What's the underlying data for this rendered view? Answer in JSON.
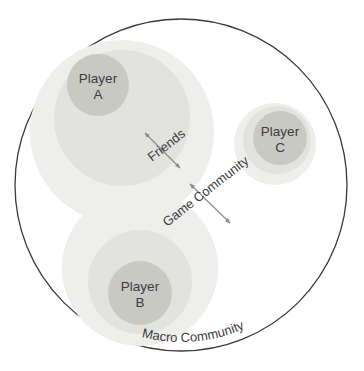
{
  "diagram": {
    "type": "nested-circle-venn",
    "background_color": "#ffffff",
    "outer": {
      "name": "Macro Community",
      "label": "Macro Community",
      "stroke_color": "#3a3a3a",
      "fill_color": "#ffffff",
      "cx": 181,
      "cy": 185,
      "r": 166,
      "stroke_width": 1.3,
      "label_placement": "curved along lower-right arc"
    },
    "colors": {
      "game_community_fill": "#eeeeec",
      "friends_fill": "#e2e2de",
      "player_fill": "#c9c9c4",
      "text": "#3c3c3c",
      "arrow": "#8a8a8a",
      "outer_stroke": "#3a3a3a"
    },
    "groups": [
      {
        "id": "group-a",
        "player_label_line1": "Player",
        "player_label_line2": "A",
        "game_community": {
          "cx": 122,
          "cy": 132,
          "r": 92
        },
        "friends": {
          "cx": 122,
          "cy": 118,
          "r": 68
        },
        "player": {
          "cx": 98,
          "cy": 85,
          "r": 31
        }
      },
      {
        "id": "group-b",
        "player_label_line1": "Player",
        "player_label_line2": "B",
        "game_community": {
          "cx": 140,
          "cy": 268,
          "r": 78
        },
        "friends": {
          "cx": 140,
          "cy": 282,
          "r": 52
        },
        "player": {
          "cx": 140,
          "cy": 293,
          "r": 32
        }
      },
      {
        "id": "group-c",
        "player_label_line1": "Player",
        "player_label_line2": "C",
        "game_community": {
          "cx": 275,
          "cy": 144,
          "r": 41
        },
        "friends": {
          "cx": 277,
          "cy": 140,
          "r": 34
        },
        "player": {
          "cx": 280,
          "cy": 138,
          "r": 27
        }
      }
    ],
    "annotations": [
      {
        "id": "friends-annotation",
        "label": "Friends",
        "rotation_deg": -38,
        "text_x": 152,
        "text_y": 162,
        "arrow": {
          "x1": 145,
          "y1": 133,
          "x2": 180,
          "y2": 168
        }
      },
      {
        "id": "game-community-annotation",
        "label": "Game Community",
        "rotation_deg": -38,
        "text_x": 167,
        "text_y": 227,
        "arrow": {
          "x1": 190,
          "y1": 184,
          "x2": 230,
          "y2": 223
        }
      }
    ]
  }
}
